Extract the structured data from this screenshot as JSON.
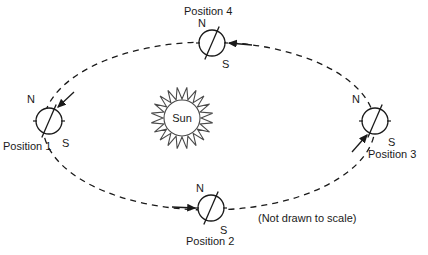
{
  "diagram": {
    "title_visible": false,
    "note": "(Not drawn to scale)",
    "colors": {
      "stroke": "#1a1a1a",
      "background": "#ffffff",
      "text": "#1a1a1a"
    },
    "sun": {
      "label": "Sun",
      "center": {
        "x": 182,
        "y": 118
      },
      "radius": 18,
      "ray_outer_radius": 31,
      "ray_points": 20
    },
    "orbit": {
      "shape": "ellipse",
      "center": {
        "x": 209,
        "y": 126
      },
      "radius_x": 166,
      "radius_y": 84,
      "style": "dashed",
      "direction": "counterclockwise"
    },
    "earths": [
      {
        "id": "position-1",
        "label": "Position 1",
        "label_pos": {
          "x": 3,
          "y": 150
        },
        "center": {
          "x": 49,
          "y": 121
        },
        "radius": 13,
        "tilt_deg": 23.5,
        "north_label": "N",
        "north_label_pos": {
          "x": 27,
          "y": 103
        },
        "south_label": "S",
        "south_label_pos": {
          "x": 62,
          "y": 147
        },
        "arrow": {
          "x1": 74,
          "y1": 92,
          "x2": 58,
          "y2": 107
        }
      },
      {
        "id": "position-2",
        "label": "Position 2",
        "label_pos": {
          "x": 186,
          "y": 245
        },
        "center": {
          "x": 211,
          "y": 208
        },
        "radius": 13,
        "tilt_deg": 23.5,
        "north_label": "N",
        "north_label_pos": {
          "x": 196,
          "y": 192
        },
        "south_label": "S",
        "south_label_pos": {
          "x": 220,
          "y": 234
        },
        "arrow": {
          "x1": 172,
          "y1": 207,
          "x2": 195,
          "y2": 208
        }
      },
      {
        "id": "position-3",
        "label": "Position 3",
        "label_pos": {
          "x": 368,
          "y": 158
        },
        "center": {
          "x": 375,
          "y": 121
        },
        "radius": 13,
        "tilt_deg": 23.5,
        "north_label": "N",
        "north_label_pos": {
          "x": 352,
          "y": 103
        },
        "south_label": "S",
        "south_label_pos": {
          "x": 388,
          "y": 146
        },
        "arrow": {
          "x1": 352,
          "y1": 152,
          "x2": 367,
          "y2": 135
        }
      },
      {
        "id": "position-4",
        "label": "Position 4",
        "label_pos": {
          "x": 184,
          "y": 15
        },
        "center": {
          "x": 212,
          "y": 43
        },
        "radius": 13,
        "tilt_deg": 23.5,
        "north_label": "N",
        "north_label_pos": {
          "x": 198,
          "y": 27
        },
        "south_label": "S",
        "south_label_pos": {
          "x": 222,
          "y": 68
        },
        "arrow": {
          "x1": 252,
          "y1": 45,
          "x2": 229,
          "y2": 43
        }
      }
    ],
    "note_pos": {
      "x": 258,
      "y": 222
    }
  }
}
